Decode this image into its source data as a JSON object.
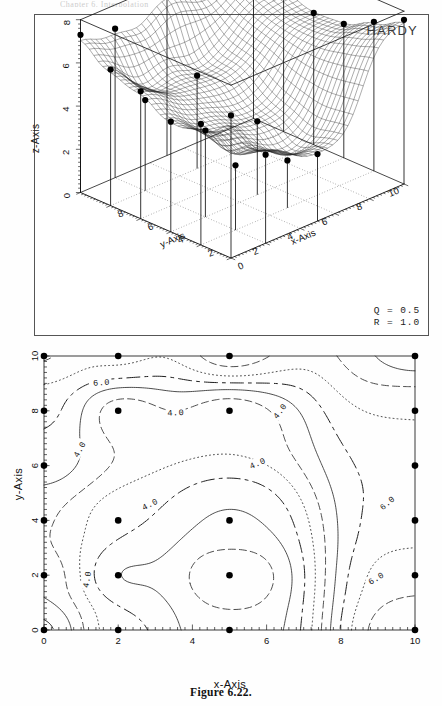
{
  "page": {
    "caption": "Figure 6.22.",
    "cropped_header_remnant": "Chapter 6. Interpolation"
  },
  "panel_3d": {
    "method_label": "HARDY",
    "params": [
      {
        "name": "Q",
        "eq": "=",
        "value": "0.5"
      },
      {
        "name": "R",
        "eq": "=",
        "value": "1.0"
      }
    ],
    "axes": {
      "x": {
        "title": "x-Axis",
        "ticks": [
          "2",
          "4",
          "6",
          "8",
          "10"
        ]
      },
      "y": {
        "title": "y-Axis",
        "ticks": [
          "0",
          "2",
          "4",
          "6",
          "8"
        ]
      },
      "z": {
        "title": "z-Axis",
        "ticks": [
          "0",
          "2",
          "4",
          "6",
          "8"
        ],
        "min": 0,
        "max": 8
      }
    },
    "surface": {
      "style": "wireframe-mesh",
      "mesh_n": 34,
      "marker": "filled-circle",
      "has_drop_lines": true
    }
  },
  "panel_contour": {
    "axes": {
      "x": {
        "title": "x-Axis",
        "ticks": [
          "0",
          "2",
          "4",
          "6",
          "8",
          "10"
        ],
        "min": 0,
        "max": 10
      },
      "y": {
        "title": "y-Axis",
        "ticks": [
          "0",
          "2",
          "4",
          "6",
          "8",
          "10"
        ],
        "min": 0,
        "max": 10
      }
    },
    "contour_labels": [
      "6.0",
      "4.0",
      "4.0",
      "4.0",
      "4.0",
      "4.0",
      "6.0",
      "6.0"
    ],
    "levels_labeled": [
      "4.0",
      "6.0"
    ]
  },
  "chart_data": {
    "type": "heatmap",
    "title": "HARDY",
    "xlabel": "x-Axis",
    "ylabel": "y-Axis",
    "zlabel": "z-Axis",
    "xlim": [
      0,
      10
    ],
    "ylim": [
      0,
      10
    ],
    "zlim": [
      0,
      8
    ],
    "grid": false,
    "legend": "none",
    "annotations": [
      "HARDY",
      "Q = 0.5",
      "R = 1.0"
    ],
    "contour_levels": [
      2.0,
      2.5,
      3.0,
      3.5,
      4.0,
      4.5,
      5.0,
      5.5,
      6.0,
      6.5,
      7.0,
      7.5
    ],
    "labeled_levels": [
      4.0,
      6.0
    ],
    "scattered_data_points": [
      {
        "x": 0,
        "y": 0,
        "z": 6.6
      },
      {
        "x": 2,
        "y": 0,
        "z": 4.1
      },
      {
        "x": 5,
        "y": 0,
        "z": 3.1
      },
      {
        "x": 10,
        "y": 0,
        "z": 7.6
      },
      {
        "x": 0,
        "y": 2,
        "z": 5.6
      },
      {
        "x": 2,
        "y": 2,
        "z": 3.0
      },
      {
        "x": 5,
        "y": 2,
        "z": 2.2
      },
      {
        "x": 10,
        "y": 2,
        "z": 6.9
      },
      {
        "x": 0,
        "y": 4,
        "z": 5.1
      },
      {
        "x": 2,
        "y": 4,
        "z": 4.0
      },
      {
        "x": 5,
        "y": 4,
        "z": 3.4
      },
      {
        "x": 10,
        "y": 4,
        "z": 6.2
      },
      {
        "x": 0,
        "y": 6,
        "z": 5.9
      },
      {
        "x": 10,
        "y": 6,
        "z": 6.1
      },
      {
        "x": 0,
        "y": 8,
        "z": 6.3
      },
      {
        "x": 2,
        "y": 8,
        "z": 4.2
      },
      {
        "x": 5,
        "y": 8,
        "z": 4.3
      },
      {
        "x": 10,
        "y": 8,
        "z": 6.5
      },
      {
        "x": 0,
        "y": 10,
        "z": 7.3
      },
      {
        "x": 2,
        "y": 10,
        "z": 6.9
      },
      {
        "x": 5,
        "y": 10,
        "z": 7.7
      },
      {
        "x": 10,
        "y": 10,
        "z": 7.9
      }
    ]
  }
}
